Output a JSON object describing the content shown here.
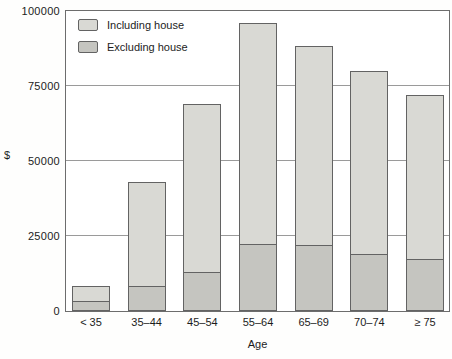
{
  "colors": {
    "bar_including": "#d9d9d4",
    "bar_excluding": "#c5c5c0",
    "bar_border": "#636363",
    "gridline": "#9a9a9a",
    "text": "#1c1c1c"
  },
  "chart_data": {
    "type": "bar",
    "title": "",
    "xlabel": "Age",
    "ylabel": "$",
    "ylim": [
      0,
      100000
    ],
    "grid": true,
    "grid_values": [
      25000,
      50000,
      75000
    ],
    "yticks": [
      {
        "value": 0,
        "label": "0"
      },
      {
        "value": 25000,
        "label": "25000"
      },
      {
        "value": 50000,
        "label": "50000"
      },
      {
        "value": 75000,
        "label": "75000"
      },
      {
        "value": 100000,
        "label": "100000"
      }
    ],
    "legend_position": "top-left-inside",
    "categories": [
      "< 35",
      "35–44",
      "45–54",
      "55–64",
      "65–69",
      "70–74",
      "≥ 75"
    ],
    "series": [
      {
        "name": "Including house",
        "values": [
          8500,
          43000,
          69000,
          96000,
          88500,
          80000,
          72000
        ]
      },
      {
        "name": "Excluding house",
        "values": [
          3500,
          8500,
          13000,
          22500,
          22000,
          19000,
          17500
        ]
      }
    ]
  }
}
